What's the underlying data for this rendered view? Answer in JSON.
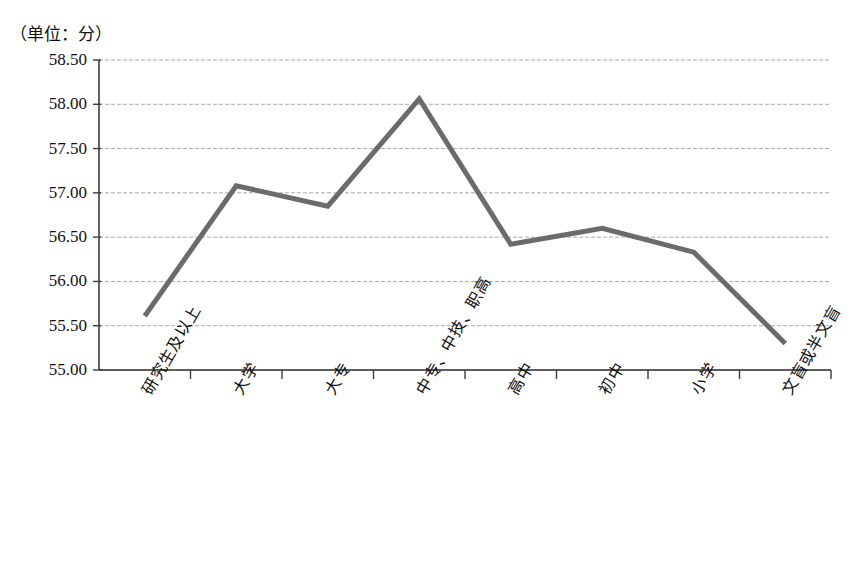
{
  "chart_data": {
    "type": "line",
    "title": "（单位：分）",
    "xlabel": "",
    "ylabel": "",
    "categories": [
      "研究生及以上",
      "大学",
      "大专",
      "中专、中技、职高",
      "高中",
      "初中",
      "小学",
      "文盲或半文盲"
    ],
    "values": [
      55.61,
      57.08,
      56.85,
      58.06,
      56.42,
      56.6,
      56.33,
      55.3
    ],
    "series": [
      {
        "name": "得分",
        "values": [
          55.61,
          57.08,
          56.85,
          58.06,
          56.42,
          56.6,
          56.33,
          55.3
        ]
      }
    ],
    "ylim": [
      55.0,
      58.5
    ],
    "ytick_values": [
      58.5,
      58.0,
      57.5,
      57.0,
      56.5,
      56.0,
      55.5,
      55.0
    ],
    "ytick_labels": [
      "58.50",
      "58.00",
      "57.50",
      "57.00",
      "56.50",
      "56.00",
      "55.50",
      "55.00"
    ],
    "grid": true,
    "grid_axis": "y",
    "legend": false,
    "legend_position": "none",
    "line_color": "#6b6b6b",
    "grid_color": "#a9a9a9",
    "axis_color": "#3c3c3c",
    "line_width": 5
  },
  "labels": {
    "unit": "（单位：分）"
  }
}
